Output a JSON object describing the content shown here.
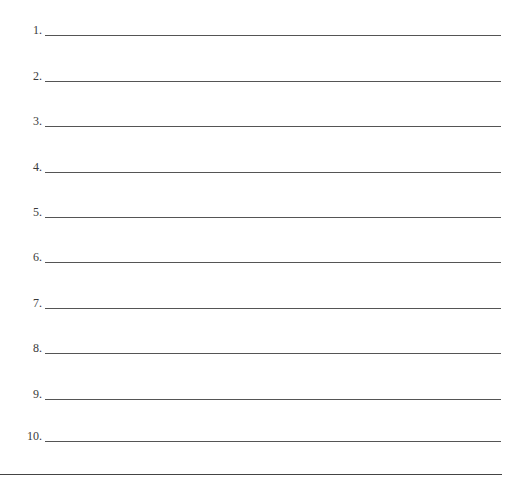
{
  "document": {
    "lines": [
      {
        "label": "1.",
        "value": ""
      },
      {
        "label": "2.",
        "value": ""
      },
      {
        "label": "3.",
        "value": ""
      },
      {
        "label": "4.",
        "value": ""
      },
      {
        "label": "5.",
        "value": ""
      },
      {
        "label": "6.",
        "value": ""
      },
      {
        "label": "7.",
        "value": ""
      },
      {
        "label": "8.",
        "value": ""
      },
      {
        "label": "9.",
        "value": ""
      },
      {
        "label": "10.",
        "value": ""
      }
    ]
  }
}
